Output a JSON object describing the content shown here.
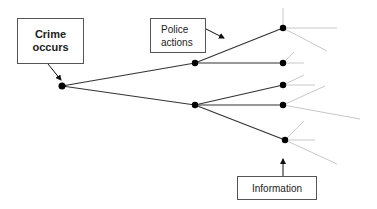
{
  "diagram": {
    "type": "decision-tree",
    "labels": {
      "crime": "Crime occurs",
      "crime_line1": "Crime",
      "crime_line2": "occurs",
      "police_line1": "Police",
      "police_line2": "actions",
      "information": "Information"
    },
    "colors": {
      "main_line": "#333333",
      "faded_line": "#c8c8c8",
      "node": "#000000",
      "box_border": "#555555"
    },
    "nodes": [
      {
        "id": "root",
        "x": 62,
        "y": 86
      },
      {
        "id": "mid-upper",
        "x": 195,
        "y": 63
      },
      {
        "id": "mid-lower",
        "x": 195,
        "y": 105
      },
      {
        "id": "leaf-1",
        "x": 283,
        "y": 28
      },
      {
        "id": "leaf-2",
        "x": 283,
        "y": 63
      },
      {
        "id": "leaf-3",
        "x": 283,
        "y": 85
      },
      {
        "id": "leaf-4",
        "x": 283,
        "y": 105
      },
      {
        "id": "leaf-5",
        "x": 285,
        "y": 140
      }
    ]
  }
}
